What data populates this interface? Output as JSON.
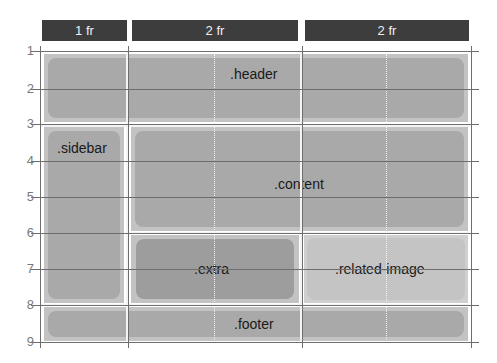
{
  "columns": [
    {
      "label": "1 fr"
    },
    {
      "label": "2 fr"
    },
    {
      "label": "2 fr"
    }
  ],
  "row_lines": [
    "1",
    "2",
    "3",
    "4",
    "5",
    "6",
    "7",
    "8",
    "9"
  ],
  "areas": {
    "header": {
      "label": ".header",
      "grid": "rows 1-3, cols 1-4"
    },
    "sidebar": {
      "label": ".sidebar",
      "grid": "rows 3-8, col 1"
    },
    "content": {
      "label": ".content",
      "grid": "rows 3-6, cols 2-4"
    },
    "extra": {
      "label": ".extra",
      "grid": "rows 6-8, col 2"
    },
    "related_image": {
      "label": ".related-image",
      "grid": "rows 6-8, col 3"
    },
    "footer": {
      "label": ".footer",
      "grid": "rows 8-9, cols 1-4"
    }
  },
  "colors": {
    "header_bar": "#3d3d3d",
    "grid_line": "#6e6e6e",
    "area_outer": "#c3c3c3",
    "area_inner": "#a9a9a9",
    "related_image_inner": "#c4c4c4",
    "extra_inner": "#9d9d9d"
  }
}
